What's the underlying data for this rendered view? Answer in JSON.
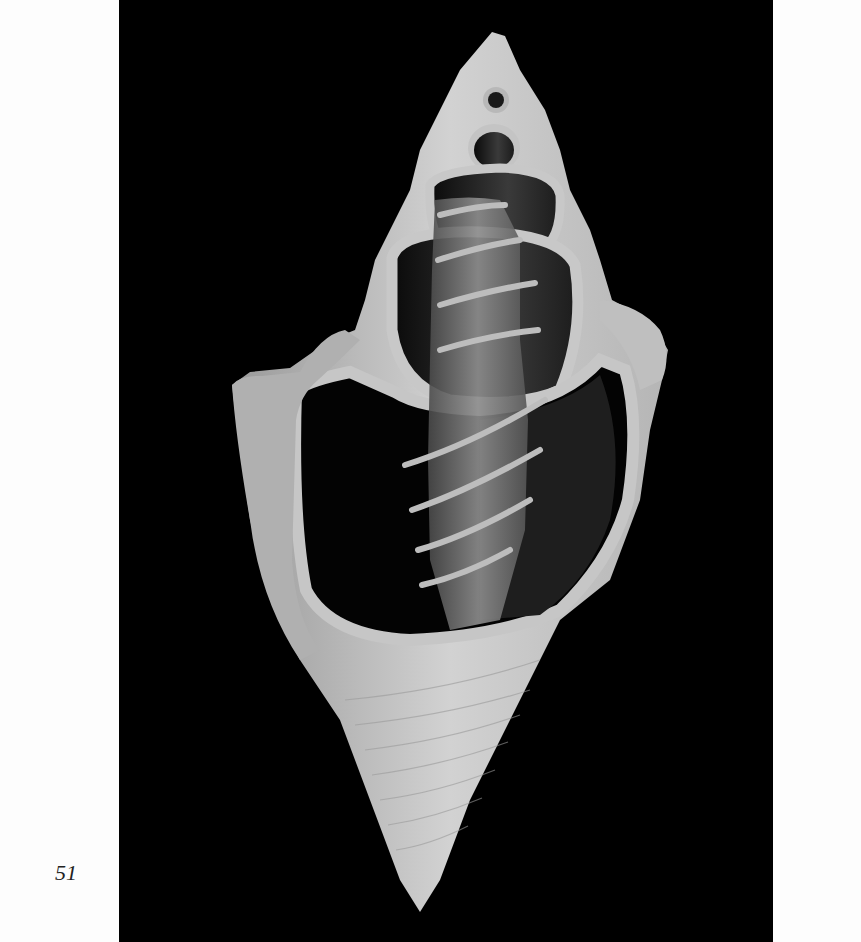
{
  "page": {
    "page_number": "51",
    "background": "#fdfdfd"
  },
  "figure": {
    "icon": "shell-illustration",
    "panel_color": "#000000",
    "shell_color": "#c9c9c9"
  }
}
